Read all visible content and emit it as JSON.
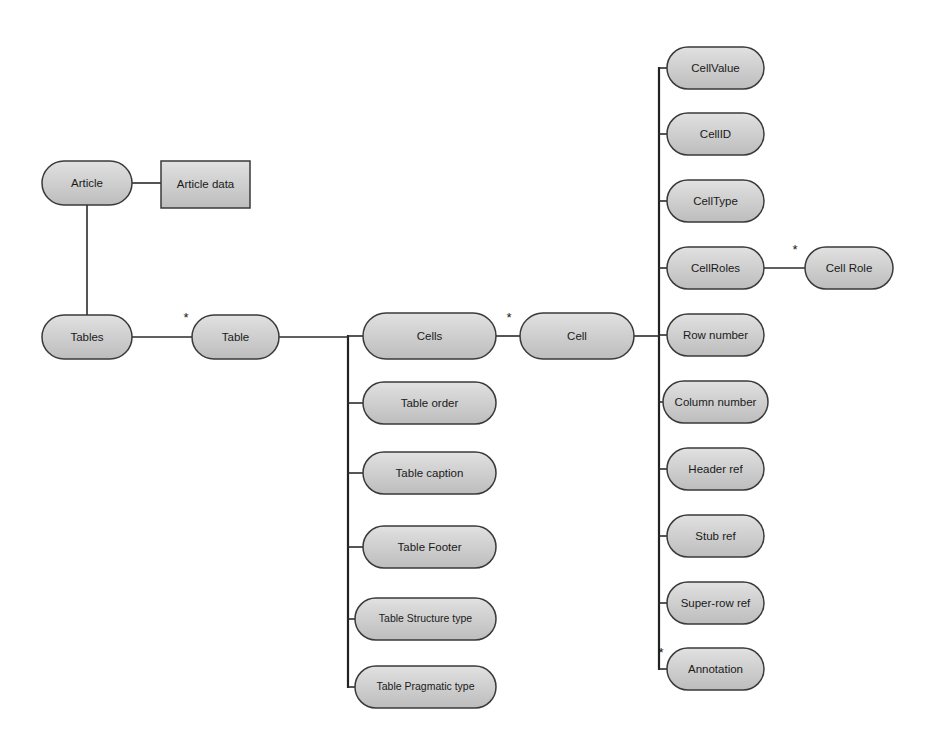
{
  "diagram": {
    "background_color": "#ffffff",
    "node_fill_top": "#dcdcdc",
    "node_fill_bottom": "#c0c0c0",
    "node_stroke_color": "#3a3a3a",
    "edge_color": "#2b2b2b",
    "label_color": "#1a1a1a",
    "multiplicity_symbol": "*"
  },
  "nodes": [
    {
      "id": "article",
      "label": "Article",
      "shape": "rounded",
      "x": 42,
      "y": 161,
      "w": 90,
      "h": 44
    },
    {
      "id": "article-data",
      "label": "Article data",
      "shape": "rect",
      "x": 161,
      "y": 161,
      "w": 89,
      "h": 47
    },
    {
      "id": "tables",
      "label": "Tables",
      "shape": "rounded",
      "x": 42,
      "y": 315,
      "w": 90,
      "h": 44
    },
    {
      "id": "table",
      "label": "Table",
      "shape": "rounded",
      "x": 192,
      "y": 315,
      "w": 87,
      "h": 44
    },
    {
      "id": "cells",
      "label": "Cells",
      "shape": "rounded",
      "x": 363,
      "y": 313,
      "w": 133,
      "h": 46
    },
    {
      "id": "cell",
      "label": "Cell",
      "shape": "rounded",
      "x": 520,
      "y": 313,
      "w": 114,
      "h": 46
    },
    {
      "id": "table-order",
      "label": "Table order",
      "shape": "rounded",
      "x": 363,
      "y": 382,
      "w": 133,
      "h": 42
    },
    {
      "id": "table-caption",
      "label": "Table caption",
      "shape": "rounded",
      "x": 363,
      "y": 452,
      "w": 133,
      "h": 42
    },
    {
      "id": "table-footer",
      "label": "Table Footer",
      "shape": "rounded",
      "x": 363,
      "y": 526,
      "w": 133,
      "h": 42
    },
    {
      "id": "table-structure-type",
      "label": "Table Structure type",
      "shape": "rounded",
      "x": 355,
      "y": 598,
      "w": 141,
      "h": 42
    },
    {
      "id": "table-pragmatic-type",
      "label": "Table Pragmatic type",
      "shape": "rounded",
      "x": 355,
      "y": 666,
      "w": 141,
      "h": 42
    },
    {
      "id": "cellvalue",
      "label": "CellValue",
      "shape": "rounded",
      "x": 667,
      "y": 47,
      "w": 97,
      "h": 42
    },
    {
      "id": "cellid",
      "label": "CellID",
      "shape": "rounded",
      "x": 667,
      "y": 113,
      "w": 97,
      "h": 42
    },
    {
      "id": "celltype",
      "label": "CellType",
      "shape": "rounded",
      "x": 667,
      "y": 180,
      "w": 97,
      "h": 42
    },
    {
      "id": "cellroles",
      "label": "CellRoles",
      "shape": "rounded",
      "x": 667,
      "y": 247,
      "w": 97,
      "h": 42
    },
    {
      "id": "cell-role",
      "label": "Cell Role",
      "shape": "rounded",
      "x": 805,
      "y": 247,
      "w": 88,
      "h": 42
    },
    {
      "id": "row-number",
      "label": "Row number",
      "shape": "rounded",
      "x": 667,
      "y": 314,
      "w": 97,
      "h": 42
    },
    {
      "id": "column-number",
      "label": "Column number",
      "shape": "rounded",
      "x": 663,
      "y": 381,
      "w": 105,
      "h": 42
    },
    {
      "id": "header-ref",
      "label": "Header ref",
      "shape": "rounded",
      "x": 667,
      "y": 448,
      "w": 97,
      "h": 42
    },
    {
      "id": "stub-ref",
      "label": "Stub ref",
      "shape": "rounded",
      "x": 667,
      "y": 515,
      "w": 97,
      "h": 42
    },
    {
      "id": "super-row-ref",
      "label": "Super-row ref",
      "shape": "rounded",
      "x": 667,
      "y": 582,
      "w": 97,
      "h": 42
    },
    {
      "id": "annotation",
      "label": "Annotation",
      "shape": "rounded",
      "x": 667,
      "y": 648,
      "w": 97,
      "h": 42
    }
  ],
  "edges": [
    {
      "id": "article-to-article-data",
      "from": "article",
      "to": "article-data",
      "kind": "horizontal",
      "points": "132,183 161,183"
    },
    {
      "id": "article-to-tables",
      "from": "article",
      "to": "tables",
      "kind": "vertical",
      "points": "87,205 87,315"
    },
    {
      "id": "tables-to-table",
      "from": "tables",
      "to": "table",
      "kind": "horizontal",
      "points": "132,337 192,337"
    },
    {
      "id": "table-to-spine",
      "from": "table",
      "to": "table-spine",
      "kind": "horizontal",
      "points": "279,337 348,337"
    },
    {
      "id": "cells-to-cell",
      "from": "cells",
      "to": "cell",
      "kind": "horizontal",
      "points": "496,336 520,336"
    },
    {
      "id": "cell-to-spine",
      "from": "cell",
      "to": "cell-spine",
      "kind": "horizontal",
      "points": "634,336 659,336"
    },
    {
      "id": "cellroles-to-cell-role",
      "from": "cellroles",
      "to": "cell-role",
      "kind": "horizontal",
      "points": "764,268 805,268"
    }
  ],
  "spines": [
    {
      "id": "table-spine",
      "parent": "table",
      "x": 348,
      "top": 336,
      "bottom": 687,
      "branch_targets": [
        "cells",
        "table-order",
        "table-caption",
        "table-footer",
        "table-structure-type",
        "table-pragmatic-type"
      ],
      "branches": [
        {
          "to": "cells",
          "y": 336,
          "x_end": 363
        },
        {
          "to": "table-order",
          "y": 403,
          "x_end": 363
        },
        {
          "to": "table-caption",
          "y": 473,
          "x_end": 363
        },
        {
          "to": "table-footer",
          "y": 547,
          "x_end": 363
        },
        {
          "to": "table-structure-type",
          "y": 619,
          "x_end": 355
        },
        {
          "to": "table-pragmatic-type",
          "y": 687,
          "x_end": 355
        }
      ]
    },
    {
      "id": "cell-spine",
      "parent": "cell",
      "x": 659,
      "top": 68,
      "bottom": 669,
      "branch_targets": [
        "cellvalue",
        "cellid",
        "celltype",
        "cellroles",
        "row-number",
        "column-number",
        "header-ref",
        "stub-ref",
        "super-row-ref",
        "annotation"
      ],
      "branches": [
        {
          "to": "cellvalue",
          "y": 68,
          "x_end": 667
        },
        {
          "to": "cellid",
          "y": 134,
          "x_end": 667
        },
        {
          "to": "celltype",
          "y": 201,
          "x_end": 667
        },
        {
          "to": "cellroles",
          "y": 268,
          "x_end": 667
        },
        {
          "to": "row-number",
          "y": 335,
          "x_end": 667
        },
        {
          "to": "column-number",
          "y": 402,
          "x_end": 663
        },
        {
          "to": "header-ref",
          "y": 469,
          "x_end": 667
        },
        {
          "to": "stub-ref",
          "y": 536,
          "x_end": 667
        },
        {
          "to": "super-row-ref",
          "y": 603,
          "x_end": 667
        },
        {
          "to": "annotation",
          "y": 669,
          "x_end": 667
        }
      ]
    }
  ],
  "multiplicities": [
    {
      "id": "mult-tables-table",
      "symbol": "*",
      "x": 186,
      "y": 319,
      "on_edge": "tables-to-table"
    },
    {
      "id": "mult-cells-cell",
      "symbol": "*",
      "x": 509,
      "y": 319,
      "on_edge": "cells-to-cell"
    },
    {
      "id": "mult-cellroles-cell-role",
      "symbol": "*",
      "x": 795,
      "y": 251,
      "on_edge": "cellroles-to-cell-role"
    },
    {
      "id": "mult-annotation",
      "symbol": "*",
      "x": 661,
      "y": 654,
      "on_edge": "cell-spine-annotation"
    }
  ]
}
